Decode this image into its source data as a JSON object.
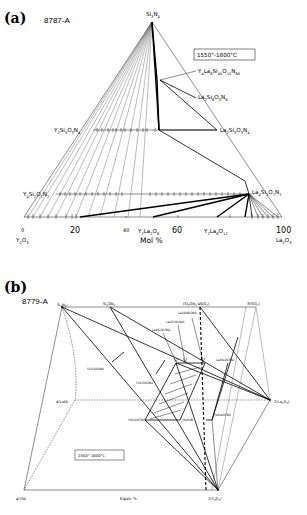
{
  "figure": {
    "panel_a": {
      "letter": "(a)",
      "code": "8787-A",
      "temperature": "1550°-1800°C",
      "apex": "Si3N4",
      "left_corner": "Y2O3",
      "right_corner": "La2O3",
      "axis_title": "Mol %",
      "axis_ticks": [
        "0",
        "20",
        "40",
        "60",
        "100"
      ],
      "phases": [
        {
          "name": "Y4La6Si45O15N60",
          "role": "quaternary phase near Si3N4"
        },
        {
          "name": "La2Si6O3N8",
          "role": "on Si3N4-La2O3 edge"
        },
        {
          "name": "La2Si3O3N4",
          "role": "on Si3N4-La2O3 edge"
        },
        {
          "name": "Y2Si3O3N4",
          "role": "on Si3N4-Y2O3 edge"
        },
        {
          "name": "Y4Si2O7N2",
          "role": "on Si3N4-Y2O3 edge"
        },
        {
          "name": "La4Si2O7N2",
          "role": "on Si3N4-La2O3 edge"
        },
        {
          "name": "Y2La2O6",
          "role": "on Y2O3-La2O3 edge"
        },
        {
          "name": "Y2La6O12",
          "role": "on Y2O3-La2O3 edge"
        }
      ]
    },
    "panel_b": {
      "letter": "(b)",
      "code": "8779-A",
      "temperature": "1550°-1800°C",
      "axis_title": "Equiv %",
      "corners": {
        "top_left": "Si3N4",
        "top_mid": "Si2ON2",
        "top_mid2": "(Si2ON2·4SiO2)",
        "top_right": "3(SiO2)",
        "mid_left": "4(LaN)",
        "mid_right": "2(La2O3)",
        "bottom_left": "4(YN)",
        "bottom_right": "2(Y2O3)"
      },
      "phases": [
        "La2Si6O3N8",
        "La4Si2O7N2",
        "LaSiO2N",
        "La2Si3O3N4",
        "Y2Si2O3N4",
        "Y2Si3O3N4",
        "Y4Si2O7N2",
        "YSiO2N",
        "La4Si2O7N2"
      ],
      "phase_labels_display": {
        "upper1": "La2Si6O3N8",
        "upper2": "La2Si3O3N4",
        "upper3": "La4Si2O7N2",
        "lasio2n": "La4Si2O7N2",
        "y2si2": "Y2Si2O3N4",
        "ysi3": "Y2Si3O3N4",
        "y4si2": "Y4Si2O7N2",
        "ysio2n": "YSiO2N",
        "y4si2b": "Y4Si2O7N2"
      }
    }
  }
}
